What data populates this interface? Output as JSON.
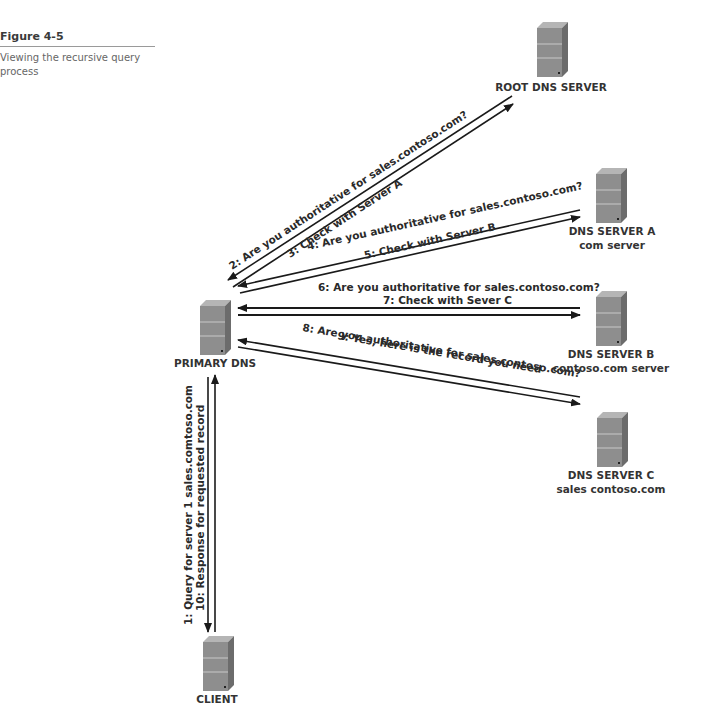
{
  "figure": {
    "number": "Figure 4-5",
    "caption": "Viewing the recursive query process"
  },
  "nodes": {
    "root": {
      "label": "ROOT DNS SERVER",
      "sublabel": ""
    },
    "server_a": {
      "label": "DNS SERVER A",
      "sublabel": "com server"
    },
    "server_b": {
      "label": "DNS SERVER B",
      "sublabel": "contoso.com server"
    },
    "server_c": {
      "label": "DNS SERVER C",
      "sublabel": "sales contoso.com"
    },
    "primary": {
      "label": "PRIMARY DNS",
      "sublabel": ""
    },
    "client": {
      "label": "CLIENT",
      "sublabel": ""
    }
  },
  "messages": {
    "m1": "1: Query for server 1 sales.comtoso.com",
    "m2": "2: Are you authoritative for sales.contoso.com?",
    "m3": "3: Check with Server A",
    "m4": "4: Are you authoritative for sales.contoso.com?",
    "m5": "5: Check with Server B",
    "m6": "6: Are you authoritative for sales.contoso.com?",
    "m7": "7: Check with Sever C",
    "m8": "8: Are you authoritative for sales.contoso.com?",
    "m9": "9: Yes, here is the record you need",
    "m10": "10: Response for requested record"
  },
  "colors": {
    "arrow": "#1a1a1a",
    "server_front": "#8c8c8c",
    "server_side": "#6e6e6e",
    "server_top": "#b0b0b0"
  }
}
